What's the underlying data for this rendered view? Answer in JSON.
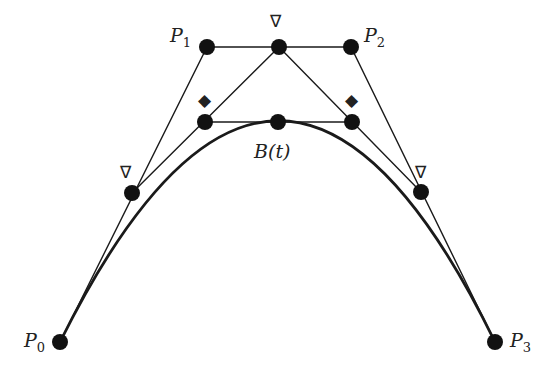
{
  "diagram": {
    "control_points": [
      {
        "name": "P0",
        "letter": "P",
        "sub": "0",
        "x": 60,
        "y": 342
      },
      {
        "name": "P1",
        "letter": "P",
        "sub": "1",
        "x": 207,
        "y": 47
      },
      {
        "name": "P2",
        "letter": "P",
        "sub": "2",
        "x": 351,
        "y": 47
      },
      {
        "name": "P3",
        "letter": "P",
        "sub": "3",
        "x": 495,
        "y": 342
      }
    ],
    "level1_points": [
      {
        "x": 132,
        "y": 193,
        "marker": "∇"
      },
      {
        "x": 279,
        "y": 47,
        "marker": "∇"
      },
      {
        "x": 421,
        "y": 192,
        "marker": "∇"
      }
    ],
    "level2_points": [
      {
        "x": 205,
        "y": 122,
        "marker": "◆"
      },
      {
        "x": 352,
        "y": 122,
        "marker": "◆"
      }
    ],
    "curve_point": {
      "label": "B(t)",
      "x": 278,
      "y": 122
    },
    "colors": {
      "stroke": "#1a1a1a",
      "background": "#ffffff"
    }
  }
}
